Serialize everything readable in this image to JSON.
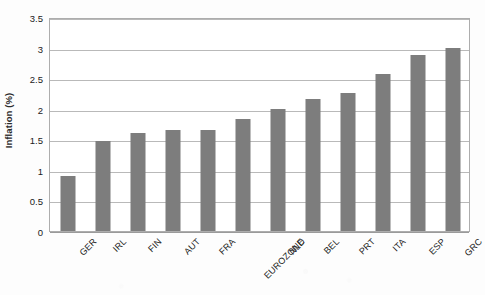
{
  "chart_data": {
    "type": "bar",
    "title": "",
    "xlabel": "",
    "ylabel": "Inflation (%)",
    "categories": [
      "GER",
      "IRL",
      "FIN",
      "AUT",
      "FRA",
      "EUROZONE",
      "NLD",
      "BEL",
      "PRT",
      "ITA",
      "ESP",
      "GRC"
    ],
    "values": [
      0.9,
      1.48,
      1.6,
      1.65,
      1.66,
      1.83,
      2.0,
      2.16,
      2.25,
      2.57,
      2.88,
      3.0
    ],
    "ylim": [
      0,
      3.5
    ],
    "yticks": [
      0,
      0.5,
      1,
      1.5,
      2,
      2.5,
      3,
      3.5
    ],
    "ytick_labels": [
      "0",
      "0.5",
      "1",
      "1.5",
      "2",
      "2.5",
      "3",
      "3.5"
    ],
    "grid": true,
    "legend": false,
    "legend_position": "none",
    "bar_color": "#7d7d7d",
    "gridline_color": "#b9b9b9",
    "frame_color": "#adadad",
    "xtick_rotation": -45
  }
}
